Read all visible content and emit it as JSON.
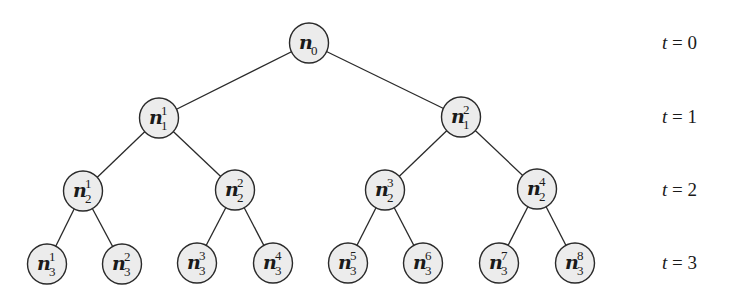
{
  "diagram": {
    "type": "binary-tree",
    "node_fill": "#ececec",
    "node_stroke": "#2a2a2a",
    "nodes": [
      {
        "id": "n0",
        "base": "n",
        "sub": "0",
        "sup": "",
        "x": 309,
        "y": 43
      },
      {
        "id": "n1_1",
        "base": "n",
        "sub": "1",
        "sup": "1",
        "x": 159,
        "y": 118
      },
      {
        "id": "n1_2",
        "base": "n",
        "sub": "1",
        "sup": "2",
        "x": 461,
        "y": 117
      },
      {
        "id": "n2_1",
        "base": "n",
        "sub": "2",
        "sup": "1",
        "x": 83,
        "y": 191
      },
      {
        "id": "n2_2",
        "base": "n",
        "sub": "2",
        "sup": "2",
        "x": 235,
        "y": 190
      },
      {
        "id": "n2_3",
        "base": "n",
        "sub": "2",
        "sup": "3",
        "x": 385,
        "y": 190
      },
      {
        "id": "n2_4",
        "base": "n",
        "sub": "2",
        "sup": "4",
        "x": 537,
        "y": 189
      },
      {
        "id": "n3_1",
        "base": "n",
        "sub": "3",
        "sup": "1",
        "x": 47,
        "y": 264
      },
      {
        "id": "n3_2",
        "base": "n",
        "sub": "3",
        "sup": "2",
        "x": 122,
        "y": 264
      },
      {
        "id": "n3_3",
        "base": "n",
        "sub": "3",
        "sup": "3",
        "x": 197,
        "y": 263
      },
      {
        "id": "n3_4",
        "base": "n",
        "sub": "3",
        "sup": "4",
        "x": 273,
        "y": 263
      },
      {
        "id": "n3_5",
        "base": "n",
        "sub": "3",
        "sup": "5",
        "x": 348,
        "y": 263
      },
      {
        "id": "n3_6",
        "base": "n",
        "sub": "3",
        "sup": "6",
        "x": 423,
        "y": 263
      },
      {
        "id": "n3_7",
        "base": "n",
        "sub": "3",
        "sup": "7",
        "x": 499,
        "y": 263
      },
      {
        "id": "n3_8",
        "base": "n",
        "sub": "3",
        "sup": "8",
        "x": 575,
        "y": 263
      }
    ],
    "edges": [
      [
        "n0",
        "n1_1"
      ],
      [
        "n0",
        "n1_2"
      ],
      [
        "n1_1",
        "n2_1"
      ],
      [
        "n1_1",
        "n2_2"
      ],
      [
        "n1_2",
        "n2_3"
      ],
      [
        "n1_2",
        "n2_4"
      ],
      [
        "n2_1",
        "n3_1"
      ],
      [
        "n2_1",
        "n3_2"
      ],
      [
        "n2_2",
        "n3_3"
      ],
      [
        "n2_2",
        "n3_4"
      ],
      [
        "n2_3",
        "n3_5"
      ],
      [
        "n2_3",
        "n3_6"
      ],
      [
        "n2_4",
        "n3_7"
      ],
      [
        "n2_4",
        "n3_8"
      ]
    ],
    "time_labels": [
      {
        "var": "t",
        "eq": " = ",
        "value": "0",
        "y": 43
      },
      {
        "var": "t",
        "eq": " = ",
        "value": "1",
        "y": 117
      },
      {
        "var": "t",
        "eq": " = ",
        "value": "2",
        "y": 190
      },
      {
        "var": "t",
        "eq": " = ",
        "value": "3",
        "y": 263
      }
    ]
  }
}
